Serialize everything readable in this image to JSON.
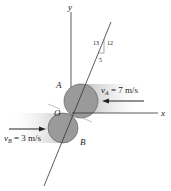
{
  "diagram": {
    "axes": {
      "x_label": "x",
      "y_label": "y"
    },
    "points": {
      "A": "A",
      "B": "B",
      "O": "O"
    },
    "slope": {
      "hyp": "13",
      "rise": "12",
      "run": "5"
    },
    "velocities": {
      "A": {
        "sym": "v",
        "sub": "A",
        "value": " = 7 m/s"
      },
      "B": {
        "sym": "v",
        "sub": "B",
        "value": " = 3 m/s"
      }
    },
    "colors": {
      "disk": "#9a9a9a",
      "disk_stroke": "#555555",
      "shade": "#bdbdbd",
      "line": "#333333"
    }
  }
}
